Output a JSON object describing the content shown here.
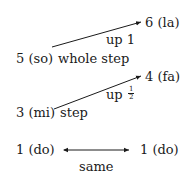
{
  "diagram": {
    "rows": [
      {
        "from": "5 (so)",
        "interval": "whole step",
        "direction": "up 1",
        "to": "6 (la)"
      },
      {
        "from": "3 (mi)",
        "interval": "step",
        "direction": "up",
        "fraction": {
          "numerator": "1",
          "denominator": "2"
        },
        "to": "4 (fa)"
      },
      {
        "from": "1 (do)",
        "interval": "same",
        "to": "1 (do)"
      }
    ]
  }
}
